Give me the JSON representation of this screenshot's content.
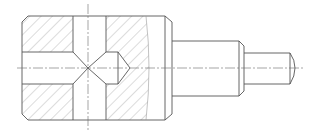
{
  "figure": {
    "type": "mechanical-section-drawing",
    "colors": {
      "background": "#ffffff",
      "outline": "#555555",
      "hatch": "#8a8a8a",
      "centerline": "#6a6a6a"
    },
    "features": [
      {
        "name": "main-body",
        "label": ""
      },
      {
        "name": "vertical-through-bore",
        "label": ""
      },
      {
        "name": "horizontal-blind-bore",
        "label": ""
      },
      {
        "name": "drill-point-cone",
        "label": ""
      },
      {
        "name": "break-line",
        "label": ""
      },
      {
        "name": "shaft-step-1",
        "label": ""
      },
      {
        "name": "shaft-step-2",
        "label": ""
      },
      {
        "name": "horizontal-centerline",
        "label": ""
      },
      {
        "name": "vertical-centerline",
        "label": ""
      }
    ]
  }
}
